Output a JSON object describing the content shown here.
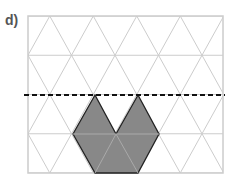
{
  "label": "d)",
  "grid": {
    "x0": 28,
    "y0": 16,
    "x1": 223,
    "y1": 173,
    "rows": 4,
    "row_h": 39.25,
    "tri_w": 43.5,
    "line_color": "#cccccc"
  },
  "shape": {
    "fill": "#888888",
    "stroke": "#222222",
    "points": "95,95 116,134 138,95 159,134 138,173 95,173 73,134"
  },
  "dashed_line": {
    "y": 95,
    "color": "#111111"
  }
}
